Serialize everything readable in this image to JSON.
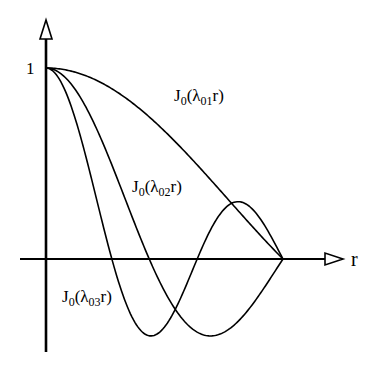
{
  "figure": {
    "type": "bessel_modes_diagram",
    "axis": {
      "x_label": "r",
      "y_tick_label": "1",
      "origin_px": [
        46,
        259
      ],
      "r_one_px": 283,
      "y_one_px": 68,
      "x_axis_start_px": 20,
      "x_axis_arrow_tip_px": 343,
      "y_axis_bottom_px": 352,
      "y_axis_arrow_tip_px": 20
    },
    "curves": [
      {
        "name": "J0_lambda01",
        "lambda": 2.405,
        "label_main": "J",
        "label_sub0": "0",
        "label_paren": "(λ",
        "label_sub": "01",
        "label_end": "r)",
        "label_pos": [
          174,
          101
        ]
      },
      {
        "name": "J0_lambda02",
        "lambda": 5.52,
        "label_main": "J",
        "label_sub0": "0",
        "label_paren": "(λ",
        "label_sub": "02",
        "label_end": "r)",
        "label_pos": [
          132,
          192
        ]
      },
      {
        "name": "J0_lambda03",
        "lambda": 8.654,
        "label_main": "J",
        "label_sub0": "0",
        "label_paren": "(λ",
        "label_sub": "03",
        "label_end": "r)",
        "label_pos": [
          62,
          302
        ]
      }
    ],
    "colors": {
      "stroke": "#000000",
      "background": "#ffffff"
    }
  },
  "chart_data": {
    "type": "line",
    "title": "",
    "xlabel": "r",
    "ylabel": "",
    "xlim": [
      0,
      1
    ],
    "ylim": [
      -0.5,
      1
    ],
    "y_ticks": [
      1
    ],
    "grid": false,
    "series": [
      {
        "name": "J0(λ01 r)",
        "lambda": 2.405,
        "zeros_r": [
          1.0
        ],
        "start": 1
      },
      {
        "name": "J0(λ02 r)",
        "lambda": 5.52,
        "zeros_r": [
          0.436,
          1.0
        ],
        "min": {
          "r": 0.694,
          "value": -0.403
        }
      },
      {
        "name": "J0(λ03 r)",
        "lambda": 8.654,
        "zeros_r": [
          0.278,
          0.638,
          1.0
        ],
        "min": {
          "r": 0.443,
          "value": -0.403
        },
        "max": {
          "r": 0.816,
          "value": 0.3
        }
      }
    ]
  }
}
